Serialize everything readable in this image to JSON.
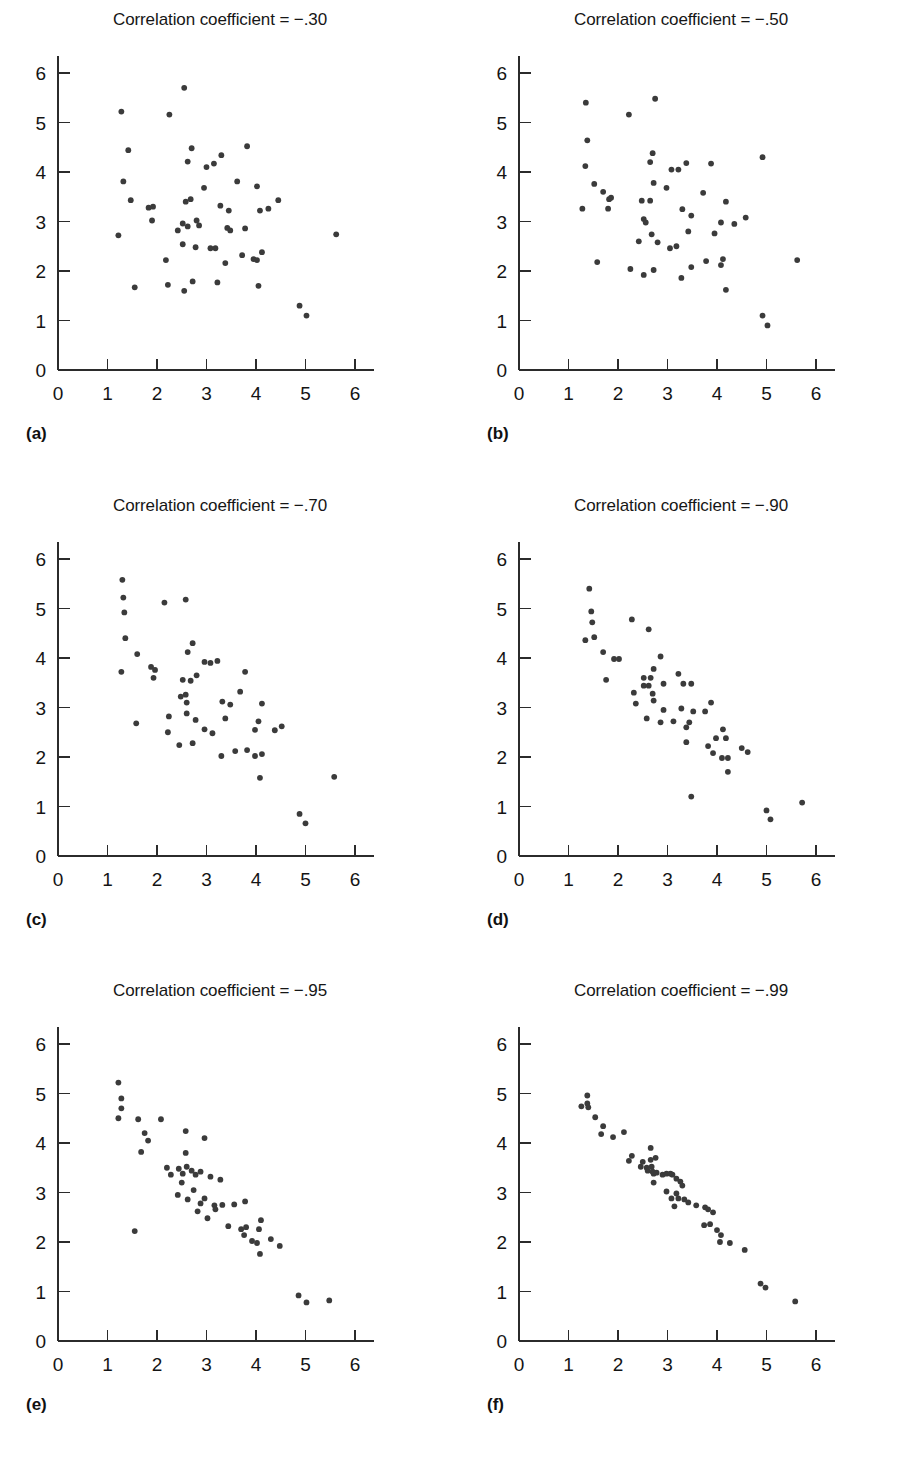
{
  "figure": {
    "title_prefix": "Correlation coefficient = ",
    "dot_color": "#3b3b3b",
    "axis_color": "#2b2b2b",
    "background": "#ffffff"
  },
  "axes": {
    "xlabel": "",
    "ylabel": "",
    "xlim": [
      0,
      6.4
    ],
    "ylim": [
      0,
      6.4
    ],
    "xticks": [
      0,
      1,
      2,
      3,
      4,
      5,
      6
    ],
    "yticks": [
      0,
      1,
      2,
      3,
      4,
      5,
      6
    ],
    "xtick_labels": [
      "0",
      "1",
      "2",
      "3",
      "4",
      "5",
      "6"
    ],
    "ytick_labels": [
      "0",
      "1",
      "2",
      "3",
      "4",
      "5",
      "6"
    ],
    "grid": false,
    "legend": "none"
  },
  "chart_data": [
    {
      "id": "a",
      "type": "scatter",
      "panel_label": "(a)",
      "title": "Correlation coefficient = −.30",
      "correlation": -0.3,
      "xlabel": "",
      "ylabel": "",
      "xlim": [
        0,
        6.4
      ],
      "ylim": [
        0,
        6.4
      ],
      "grid": false,
      "points": [
        [
          2.55,
          5.7
        ],
        [
          1.28,
          5.22
        ],
        [
          2.25,
          5.16
        ],
        [
          1.42,
          4.44
        ],
        [
          2.7,
          4.48
        ],
        [
          3.82,
          4.52
        ],
        [
          2.62,
          4.21
        ],
        [
          3.0,
          4.1
        ],
        [
          3.15,
          4.17
        ],
        [
          3.3,
          4.34
        ],
        [
          1.32,
          3.81
        ],
        [
          2.95,
          3.68
        ],
        [
          3.62,
          3.81
        ],
        [
          4.02,
          3.71
        ],
        [
          1.47,
          3.43
        ],
        [
          2.58,
          3.4
        ],
        [
          2.68,
          3.45
        ],
        [
          4.45,
          3.43
        ],
        [
          1.83,
          3.28
        ],
        [
          1.92,
          3.3
        ],
        [
          3.28,
          3.32
        ],
        [
          3.45,
          3.22
        ],
        [
          4.08,
          3.22
        ],
        [
          4.25,
          3.26
        ],
        [
          1.9,
          3.02
        ],
        [
          2.42,
          2.82
        ],
        [
          2.52,
          2.96
        ],
        [
          2.62,
          2.9
        ],
        [
          2.8,
          3.02
        ],
        [
          2.85,
          2.92
        ],
        [
          3.42,
          2.87
        ],
        [
          3.48,
          2.82
        ],
        [
          3.78,
          2.86
        ],
        [
          1.22,
          2.72
        ],
        [
          5.62,
          2.74
        ],
        [
          2.52,
          2.54
        ],
        [
          2.78,
          2.48
        ],
        [
          3.08,
          2.46
        ],
        [
          3.18,
          2.46
        ],
        [
          4.12,
          2.38
        ],
        [
          3.72,
          2.32
        ],
        [
          3.95,
          2.24
        ],
        [
          4.02,
          2.22
        ],
        [
          3.38,
          2.16
        ],
        [
          2.18,
          2.22
        ],
        [
          1.55,
          1.67
        ],
        [
          2.22,
          1.72
        ],
        [
          2.55,
          1.6
        ],
        [
          2.72,
          1.79
        ],
        [
          3.22,
          1.77
        ],
        [
          4.05,
          1.7
        ],
        [
          4.88,
          1.3
        ],
        [
          5.02,
          1.1
        ]
      ]
    },
    {
      "id": "b",
      "type": "scatter",
      "panel_label": "(b)",
      "title": "Correlation coefficient = −.50",
      "correlation": -0.5,
      "xlabel": "",
      "ylabel": "",
      "xlim": [
        0,
        6.4
      ],
      "ylim": [
        0,
        6.4
      ],
      "grid": false,
      "points": [
        [
          1.35,
          5.4
        ],
        [
          2.75,
          5.48
        ],
        [
          2.22,
          5.16
        ],
        [
          1.38,
          4.64
        ],
        [
          1.34,
          4.12
        ],
        [
          2.7,
          4.38
        ],
        [
          2.65,
          4.2
        ],
        [
          3.38,
          4.18
        ],
        [
          3.88,
          4.17
        ],
        [
          4.92,
          4.3
        ],
        [
          3.08,
          4.05
        ],
        [
          3.22,
          4.05
        ],
        [
          1.52,
          3.76
        ],
        [
          2.72,
          3.78
        ],
        [
          1.7,
          3.6
        ],
        [
          2.98,
          3.68
        ],
        [
          1.82,
          3.45
        ],
        [
          1.86,
          3.48
        ],
        [
          2.48,
          3.42
        ],
        [
          2.65,
          3.42
        ],
        [
          3.72,
          3.58
        ],
        [
          1.28,
          3.26
        ],
        [
          1.8,
          3.26
        ],
        [
          4.18,
          3.4
        ],
        [
          3.3,
          3.25
        ],
        [
          2.52,
          3.05
        ],
        [
          2.56,
          2.98
        ],
        [
          3.48,
          3.12
        ],
        [
          4.58,
          3.08
        ],
        [
          4.08,
          2.98
        ],
        [
          4.35,
          2.95
        ],
        [
          3.42,
          2.8
        ],
        [
          3.95,
          2.76
        ],
        [
          2.42,
          2.6
        ],
        [
          2.68,
          2.74
        ],
        [
          2.8,
          2.58
        ],
        [
          3.05,
          2.46
        ],
        [
          3.18,
          2.5
        ],
        [
          1.58,
          2.18
        ],
        [
          5.62,
          2.22
        ],
        [
          2.25,
          2.04
        ],
        [
          2.72,
          2.02
        ],
        [
          2.52,
          1.92
        ],
        [
          3.48,
          2.08
        ],
        [
          3.78,
          2.2
        ],
        [
          4.08,
          2.12
        ],
        [
          4.12,
          2.24
        ],
        [
          3.28,
          1.86
        ],
        [
          4.18,
          1.62
        ],
        [
          4.92,
          1.1
        ],
        [
          5.02,
          0.9
        ]
      ]
    },
    {
      "id": "c",
      "type": "scatter",
      "panel_label": "(c)",
      "title": "Correlation coefficient = −.70",
      "correlation": -0.7,
      "xlabel": "",
      "ylabel": "",
      "xlim": [
        0,
        6.4
      ],
      "ylim": [
        0,
        6.4
      ],
      "grid": false,
      "points": [
        [
          1.3,
          5.58
        ],
        [
          1.32,
          5.22
        ],
        [
          2.15,
          5.12
        ],
        [
          2.58,
          5.18
        ],
        [
          1.34,
          4.92
        ],
        [
          1.36,
          4.4
        ],
        [
          1.6,
          4.08
        ],
        [
          2.72,
          4.3
        ],
        [
          2.62,
          4.12
        ],
        [
          1.28,
          3.72
        ],
        [
          1.88,
          3.82
        ],
        [
          1.96,
          3.76
        ],
        [
          1.93,
          3.6
        ],
        [
          2.96,
          3.92
        ],
        [
          3.08,
          3.9
        ],
        [
          3.22,
          3.94
        ],
        [
          2.8,
          3.65
        ],
        [
          2.52,
          3.56
        ],
        [
          2.68,
          3.54
        ],
        [
          3.78,
          3.72
        ],
        [
          2.48,
          3.22
        ],
        [
          2.58,
          3.26
        ],
        [
          2.6,
          3.1
        ],
        [
          3.32,
          3.12
        ],
        [
          3.48,
          3.06
        ],
        [
          4.12,
          3.08
        ],
        [
          3.68,
          3.32
        ],
        [
          2.24,
          2.82
        ],
        [
          2.6,
          2.88
        ],
        [
          2.78,
          2.75
        ],
        [
          3.38,
          2.78
        ],
        [
          2.22,
          2.5
        ],
        [
          2.96,
          2.56
        ],
        [
          3.12,
          2.48
        ],
        [
          3.98,
          2.55
        ],
        [
          4.05,
          2.72
        ],
        [
          4.38,
          2.54
        ],
        [
          4.52,
          2.62
        ],
        [
          1.58,
          2.68
        ],
        [
          2.45,
          2.24
        ],
        [
          2.72,
          2.28
        ],
        [
          3.3,
          2.02
        ],
        [
          3.58,
          2.12
        ],
        [
          3.82,
          2.14
        ],
        [
          3.98,
          2.02
        ],
        [
          4.12,
          2.06
        ],
        [
          4.08,
          1.58
        ],
        [
          5.58,
          1.6
        ],
        [
          4.88,
          0.85
        ],
        [
          5.0,
          0.66
        ]
      ]
    },
    {
      "id": "d",
      "type": "scatter",
      "panel_label": "(d)",
      "title": "Correlation coefficient = −.90",
      "correlation": -0.9,
      "xlabel": "",
      "ylabel": "",
      "xlim": [
        0,
        6.4
      ],
      "ylim": [
        0,
        6.4
      ],
      "grid": false,
      "points": [
        [
          1.42,
          5.4
        ],
        [
          1.46,
          4.94
        ],
        [
          1.48,
          4.72
        ],
        [
          2.28,
          4.78
        ],
        [
          2.62,
          4.58
        ],
        [
          1.34,
          4.36
        ],
        [
          1.52,
          4.42
        ],
        [
          1.7,
          4.12
        ],
        [
          1.92,
          3.98
        ],
        [
          2.02,
          3.98
        ],
        [
          1.76,
          3.56
        ],
        [
          2.86,
          4.03
        ],
        [
          2.72,
          3.78
        ],
        [
          3.22,
          3.68
        ],
        [
          2.52,
          3.6
        ],
        [
          2.66,
          3.6
        ],
        [
          2.52,
          3.44
        ],
        [
          2.62,
          3.44
        ],
        [
          2.92,
          3.48
        ],
        [
          3.32,
          3.48
        ],
        [
          3.48,
          3.48
        ],
        [
          2.32,
          3.3
        ],
        [
          2.7,
          3.28
        ],
        [
          2.36,
          3.08
        ],
        [
          2.72,
          3.14
        ],
        [
          3.88,
          3.1
        ],
        [
          2.92,
          2.95
        ],
        [
          3.28,
          2.98
        ],
        [
          3.52,
          2.92
        ],
        [
          3.76,
          2.92
        ],
        [
          2.58,
          2.78
        ],
        [
          2.86,
          2.7
        ],
        [
          3.12,
          2.72
        ],
        [
          3.44,
          2.7
        ],
        [
          3.38,
          2.6
        ],
        [
          4.12,
          2.56
        ],
        [
          3.38,
          2.3
        ],
        [
          3.82,
          2.22
        ],
        [
          3.98,
          2.38
        ],
        [
          4.18,
          2.38
        ],
        [
          4.5,
          2.18
        ],
        [
          4.62,
          2.1
        ],
        [
          3.92,
          2.08
        ],
        [
          4.1,
          1.98
        ],
        [
          4.22,
          1.98
        ],
        [
          4.22,
          1.7
        ],
        [
          3.48,
          1.2
        ],
        [
          5.0,
          0.92
        ],
        [
          5.08,
          0.74
        ],
        [
          5.72,
          1.08
        ]
      ]
    },
    {
      "id": "e",
      "type": "scatter",
      "panel_label": "(e)",
      "title": "Correlation coefficient = −.95",
      "correlation": -0.95,
      "xlabel": "",
      "ylabel": "",
      "xlim": [
        0,
        6.4
      ],
      "ylim": [
        0,
        6.4
      ],
      "grid": false,
      "points": [
        [
          1.22,
          5.22
        ],
        [
          1.28,
          4.9
        ],
        [
          1.28,
          4.7
        ],
        [
          1.22,
          4.5
        ],
        [
          1.62,
          4.48
        ],
        [
          2.08,
          4.48
        ],
        [
          1.75,
          4.2
        ],
        [
          1.82,
          4.05
        ],
        [
          1.68,
          3.82
        ],
        [
          2.58,
          4.24
        ],
        [
          2.96,
          4.1
        ],
        [
          2.58,
          3.8
        ],
        [
          2.2,
          3.5
        ],
        [
          2.44,
          3.48
        ],
        [
          2.6,
          3.52
        ],
        [
          2.7,
          3.44
        ],
        [
          2.88,
          3.42
        ],
        [
          2.28,
          3.36
        ],
        [
          2.52,
          3.38
        ],
        [
          2.78,
          3.36
        ],
        [
          3.08,
          3.32
        ],
        [
          3.28,
          3.26
        ],
        [
          2.5,
          3.2
        ],
        [
          2.74,
          3.05
        ],
        [
          2.42,
          2.95
        ],
        [
          2.62,
          2.86
        ],
        [
          2.96,
          2.88
        ],
        [
          2.88,
          2.78
        ],
        [
          3.16,
          2.74
        ],
        [
          3.32,
          2.75
        ],
        [
          3.56,
          2.76
        ],
        [
          3.78,
          2.82
        ],
        [
          2.82,
          2.62
        ],
        [
          3.18,
          2.66
        ],
        [
          3.02,
          2.48
        ],
        [
          1.55,
          2.22
        ],
        [
          3.44,
          2.32
        ],
        [
          3.8,
          2.3
        ],
        [
          3.76,
          2.14
        ],
        [
          3.7,
          2.26
        ],
        [
          4.1,
          2.44
        ],
        [
          4.06,
          2.26
        ],
        [
          3.92,
          2.02
        ],
        [
          4.02,
          1.98
        ],
        [
          4.3,
          2.06
        ],
        [
          4.48,
          1.92
        ],
        [
          4.08,
          1.76
        ],
        [
          4.86,
          0.92
        ],
        [
          5.02,
          0.78
        ],
        [
          5.48,
          0.82
        ]
      ]
    },
    {
      "id": "f",
      "type": "scatter",
      "panel_label": "(f)",
      "title": "Correlation coefficient = −.99",
      "correlation": -0.99,
      "xlabel": "",
      "ylabel": "",
      "xlim": [
        0,
        6.4
      ],
      "ylim": [
        0,
        6.4
      ],
      "grid": false,
      "points": [
        [
          1.38,
          4.96
        ],
        [
          1.26,
          4.74
        ],
        [
          1.38,
          4.8
        ],
        [
          1.4,
          4.72
        ],
        [
          1.54,
          4.52
        ],
        [
          1.7,
          4.34
        ],
        [
          1.66,
          4.18
        ],
        [
          1.9,
          4.12
        ],
        [
          2.12,
          4.22
        ],
        [
          2.28,
          3.74
        ],
        [
          2.22,
          3.64
        ],
        [
          2.66,
          3.9
        ],
        [
          2.5,
          3.62
        ],
        [
          2.66,
          3.66
        ],
        [
          2.76,
          3.7
        ],
        [
          2.46,
          3.52
        ],
        [
          2.58,
          3.5
        ],
        [
          2.68,
          3.52
        ],
        [
          2.6,
          3.44
        ],
        [
          2.7,
          3.42
        ],
        [
          2.72,
          3.38
        ],
        [
          2.78,
          3.4
        ],
        [
          2.9,
          3.36
        ],
        [
          2.98,
          3.38
        ],
        [
          3.06,
          3.38
        ],
        [
          3.1,
          3.36
        ],
        [
          2.72,
          3.2
        ],
        [
          3.18,
          3.28
        ],
        [
          3.26,
          3.22
        ],
        [
          3.3,
          3.14
        ],
        [
          2.98,
          3.02
        ],
        [
          3.18,
          2.98
        ],
        [
          3.08,
          2.88
        ],
        [
          3.22,
          2.88
        ],
        [
          3.34,
          2.86
        ],
        [
          3.42,
          2.8
        ],
        [
          3.14,
          2.72
        ],
        [
          3.58,
          2.74
        ],
        [
          3.76,
          2.7
        ],
        [
          3.82,
          2.66
        ],
        [
          3.92,
          2.6
        ],
        [
          3.74,
          2.34
        ],
        [
          3.86,
          2.36
        ],
        [
          4.0,
          2.24
        ],
        [
          4.08,
          2.14
        ],
        [
          4.06,
          2.0
        ],
        [
          4.26,
          1.98
        ],
        [
          4.56,
          1.84
        ],
        [
          4.88,
          1.16
        ],
        [
          4.98,
          1.08
        ],
        [
          5.58,
          0.8
        ]
      ]
    }
  ]
}
